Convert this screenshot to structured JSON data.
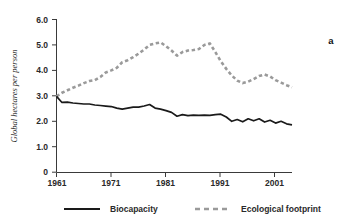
{
  "panel": {
    "label": "a"
  },
  "axes": {
    "y_title": "Global hectares per person",
    "y_ticks": [
      "6.0",
      "5.0",
      "4.0",
      "3.0",
      "2.0",
      "1.0",
      "0"
    ],
    "x_ticks": [
      "1961",
      "1971",
      "1981",
      "1991",
      "2001"
    ]
  },
  "legend": {
    "items": [
      {
        "label": "Biocapacity",
        "style": "solid",
        "color": "#1a1a1a"
      },
      {
        "label": "Ecological footprint",
        "style": "dashed",
        "color": "#9a9a9a"
      }
    ]
  },
  "chart_data": {
    "type": "line",
    "title": "",
    "xlabel": "",
    "ylabel": "Global hectares per person",
    "xlim": [
      1961,
      2004
    ],
    "ylim": [
      0,
      6
    ],
    "yticks": [
      0,
      1,
      2,
      3,
      4,
      5,
      6
    ],
    "xticks": [
      1961,
      1971,
      1981,
      1991,
      2001
    ],
    "grid": false,
    "legend_position": "bottom",
    "x": [
      1961,
      1962,
      1963,
      1964,
      1965,
      1966,
      1967,
      1968,
      1969,
      1970,
      1971,
      1972,
      1973,
      1974,
      1975,
      1976,
      1977,
      1978,
      1979,
      1980,
      1981,
      1982,
      1983,
      1984,
      1985,
      1986,
      1987,
      1988,
      1989,
      1990,
      1991,
      1992,
      1993,
      1994,
      1995,
      1996,
      1997,
      1998,
      1999,
      2000,
      2001,
      2002,
      2003,
      2004
    ],
    "series": [
      {
        "name": "Biocapacity",
        "style": "solid",
        "color": "#1a1a1a",
        "values": [
          2.98,
          2.74,
          2.75,
          2.72,
          2.7,
          2.68,
          2.68,
          2.64,
          2.62,
          2.6,
          2.58,
          2.52,
          2.48,
          2.52,
          2.56,
          2.56,
          2.6,
          2.66,
          2.52,
          2.48,
          2.42,
          2.35,
          2.2,
          2.26,
          2.22,
          2.24,
          2.23,
          2.24,
          2.23,
          2.26,
          2.28,
          2.17,
          2.0,
          2.07,
          1.98,
          2.1,
          2.02,
          2.1,
          1.97,
          2.04,
          1.93,
          2.0,
          1.9,
          1.86
        ]
      },
      {
        "name": "Ecological footprint",
        "style": "dashed",
        "color": "#9a9a9a",
        "values": [
          2.98,
          3.12,
          3.22,
          3.32,
          3.4,
          3.5,
          3.58,
          3.62,
          3.74,
          3.92,
          4.0,
          4.1,
          4.32,
          4.4,
          4.52,
          4.66,
          4.82,
          5.0,
          5.06,
          5.1,
          4.95,
          4.78,
          4.58,
          4.72,
          4.78,
          4.8,
          4.84,
          5.0,
          5.06,
          4.72,
          4.36,
          4.06,
          3.8,
          3.6,
          3.5,
          3.56,
          3.66,
          3.78,
          3.84,
          3.76,
          3.62,
          3.52,
          3.42,
          3.34
        ]
      }
    ]
  }
}
